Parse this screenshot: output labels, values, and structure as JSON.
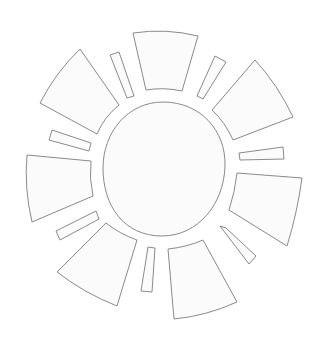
{
  "illustration": {
    "subject": "sun line-art outline",
    "colors": {
      "background": "#ffffff",
      "fill": "#fbfbfb",
      "stroke": "#8a8a8a"
    },
    "core": {
      "d": "M163,102 C200,102 226,130 225,166 C224,204 198,236 162,236 C124,236 103,206 103,168 C103,132 128,102 163,102 Z"
    },
    "large_rays": [
      {
        "name": "ray-top",
        "d": "M133,33 Q166,28 198,36 L182,91 Q164,87 146,90 Z"
      },
      {
        "name": "ray-upper-right",
        "d": "M255,60 Q278,85 293,117 L233,140 Q225,122 212,110 Z"
      },
      {
        "name": "ray-right",
        "d": "M237,173 L302,178 Q297,214 287,246 L229,210 Q235,192 237,173 Z"
      },
      {
        "name": "ray-bottom",
        "d": "M168,249 Q187,247 203,240 L237,302 Q206,316 174,319 Z"
      },
      {
        "name": "ray-lower-left",
        "d": "M106,223 Q120,234 137,240 L117,306 Q84,293 57,272 Z"
      },
      {
        "name": "ray-left",
        "d": "M27,155 L91,161 Q89,178 93,196 L32,222 Q24,188 27,155 Z"
      },
      {
        "name": "ray-upper-left",
        "d": "M80,49 L119,105 Q104,117 97,134 L40,103 Q56,72 80,49 Z"
      }
    ],
    "small_rays": [
      {
        "name": "small-ray-top-left",
        "d": "M110,55 L119,52 L134,96 L127,98 Z"
      },
      {
        "name": "small-ray-top-right",
        "d": "M215,56 L226,62 L203,99 L197,96 Z"
      },
      {
        "name": "small-ray-right",
        "d": "M239,153 L283,147 L284,159 L240,160 Z"
      },
      {
        "name": "small-ray-lower-right",
        "d": "M220,226 L226,228 L256,256 L249,264 Z"
      },
      {
        "name": "small-ray-bottom",
        "d": "M148,247 L155,248 L152,292 L141,291 Z"
      },
      {
        "name": "small-ray-lower-left",
        "d": "M56,231 L96,211 L99,219 L60,240 Z"
      },
      {
        "name": "small-ray-left",
        "d": "M52,130 L91,143 L89,151 L49,140 Z"
      }
    ]
  }
}
